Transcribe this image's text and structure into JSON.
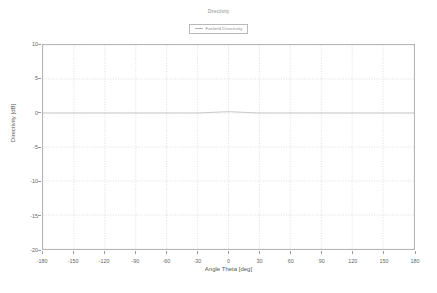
{
  "chart_data": {
    "type": "line",
    "title": "Directivity",
    "xlabel": "Angle Theta [deg]",
    "ylabel": "Directivity [dB]",
    "xlim": [
      -180,
      180
    ],
    "ylim": [
      -20,
      10
    ],
    "xticks": [
      -180,
      -150,
      -120,
      -90,
      -60,
      -30,
      0,
      30,
      60,
      90,
      120,
      150,
      180
    ],
    "xticklabels": [
      "-180",
      "-150",
      "-120",
      "-90",
      "-60",
      "-30",
      "0",
      "30",
      "60",
      "90",
      "120",
      "150",
      "180"
    ],
    "yticks": [
      10,
      5,
      0,
      -5,
      -10,
      -15,
      -20
    ],
    "yticklabels": [
      "10",
      "5",
      "0",
      "-5",
      "-10",
      "-15",
      "-20"
    ],
    "grid": true,
    "legend_position": "top-center",
    "series": [
      {
        "name": "Farfield Directivity",
        "color": "#b4b4b4",
        "x": [
          -180,
          -150,
          -120,
          -90,
          -60,
          -30,
          -15,
          0,
          15,
          30,
          60,
          90,
          120,
          150,
          180
        ],
        "values": [
          0.0,
          0.0,
          0.0,
          0.0,
          0.0,
          0.0,
          0.1,
          0.2,
          0.1,
          0.0,
          0.0,
          0.0,
          0.0,
          0.0,
          0.0
        ]
      }
    ]
  },
  "legend": {
    "title": "Directivity",
    "entries": [
      {
        "label": "Farfield Directivity",
        "color": "#b4b4b4"
      }
    ]
  },
  "axes": {
    "x_title": "Angle Theta [deg]",
    "y_title": "Directivity [dB]"
  }
}
